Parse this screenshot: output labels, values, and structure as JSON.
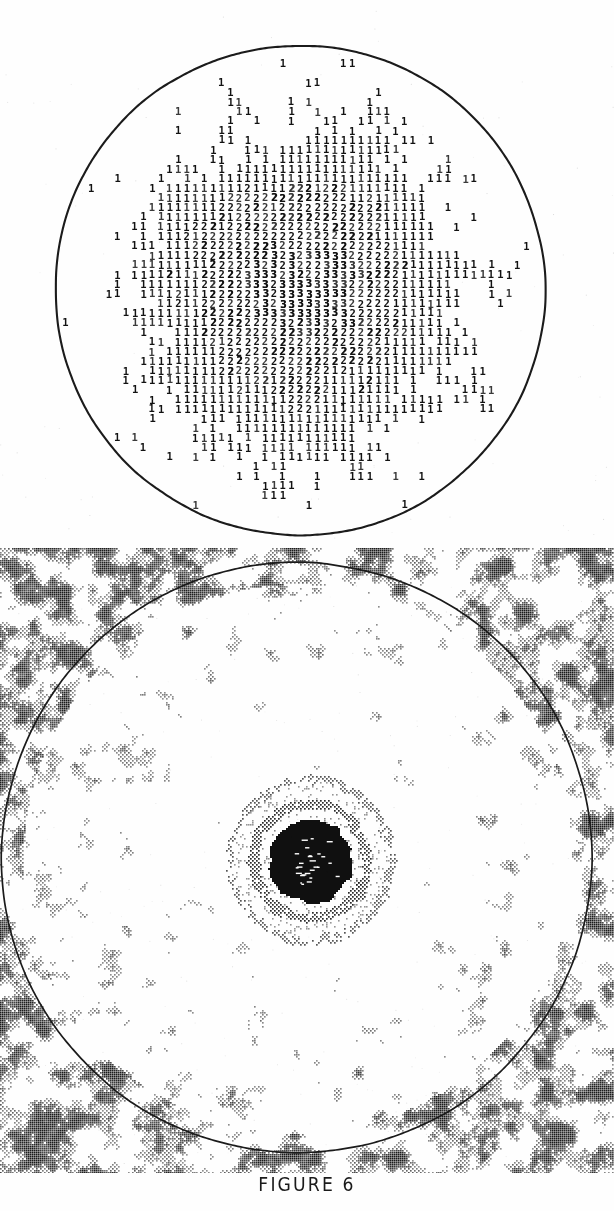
{
  "document": {
    "background_color": "#fefefe",
    "ink_color": "#111111",
    "page_width": 614,
    "page_height": 1211
  },
  "caption": {
    "text": "FIGURE 6"
  },
  "figures": [
    {
      "id": "top-character-plot",
      "name": "character-density-plot",
      "kind": "line-printer-character-map",
      "description": "Circular aperture filled with overstruck printer characters forming a radial density map",
      "symbols": [
        "1",
        "2",
        "3"
      ],
      "symbol_meaning": {
        "blank": "lowest level",
        "1": "low level",
        "2": "medium level",
        "3": "high level"
      },
      "circle": {
        "cx": 300,
        "cy": 290,
        "r": 245
      },
      "cell_width": 8.7,
      "cell_height": 9.6,
      "core": {
        "cx": 300,
        "cy": 288,
        "r": 150
      }
    },
    {
      "id": "bottom-contour-plot",
      "name": "speckle-contour-plot",
      "kind": "line-printer-contour-map",
      "description": "Circular aperture over a dense mottled speckle field with a dark concentric target at center",
      "circle": {
        "cx": 297,
        "cy": 858,
        "r": 295
      },
      "target": {
        "cx": 310,
        "cy": 860,
        "core_r": 42,
        "rings": [
          52,
          62,
          72
        ]
      },
      "speckle": {
        "inner_density": 0.1,
        "outer_density": 0.62
      }
    }
  ],
  "chart_data": {
    "type": "heatmap",
    "title": "FIGURE 6",
    "xlabel": "",
    "ylabel": "",
    "panels": [
      {
        "name": "top-character-plot",
        "type": "heatmap",
        "render": "ascii-characters",
        "levels": [
          " ",
          "1",
          "2",
          "3"
        ],
        "level_values": [
          0,
          1,
          2,
          3
        ],
        "grid_cols": 57,
        "grid_rows": 52,
        "profile": "radial-gaussian",
        "peak_level": 3,
        "peak_at": [
          0.5,
          0.5
        ],
        "clip_shape": "circle",
        "notes": "Density falls from 2-3 at the centre to isolated 1s near the circular boundary"
      },
      {
        "name": "bottom-contour-plot",
        "type": "heatmap",
        "render": "dot-speckle",
        "levels": [
          0,
          1
        ],
        "clip_shape": "none",
        "overlay_shape": "circle",
        "profile": "noise-field-with-central-peak",
        "peak_at": [
          0.52,
          0.5
        ],
        "notes": "Dark saturated core surrounded by three faint concentric rings; speckle noise dense outside the circle, sparse inside"
      }
    ]
  }
}
